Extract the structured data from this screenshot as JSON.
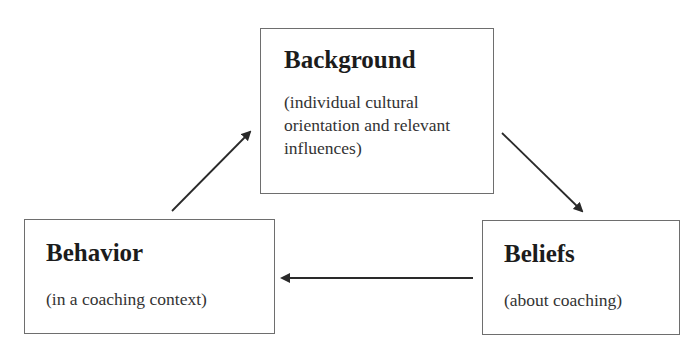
{
  "diagram": {
    "type": "cycle",
    "nodes": [
      {
        "id": "background",
        "title": "Background",
        "description": "(individual cultural orientation and relevant influences)"
      },
      {
        "id": "beliefs",
        "title": "Beliefs",
        "description": "(about coaching)"
      },
      {
        "id": "behavior",
        "title": "Behavior",
        "description": "(in a coaching context)"
      }
    ],
    "edges": [
      {
        "from": "background",
        "to": "beliefs",
        "direction": "down-right"
      },
      {
        "from": "beliefs",
        "to": "behavior",
        "direction": "left"
      },
      {
        "from": "behavior",
        "to": "background",
        "direction": "up-right"
      }
    ],
    "colors": {
      "border": "#6e6e6e",
      "arrow": "#2a2a2a",
      "text": "#1e1e1e"
    }
  }
}
